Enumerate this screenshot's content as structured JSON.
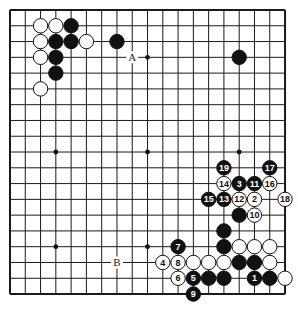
{
  "board": {
    "size": 19,
    "origin_x": 10,
    "origin_y": 10,
    "spacing_x": 15.28,
    "spacing_y": 15.78,
    "line_color": "#1a1a1a",
    "background": "#ffffff",
    "star_points": [
      [
        3,
        3
      ],
      [
        9,
        3
      ],
      [
        15,
        3
      ],
      [
        3,
        9
      ],
      [
        9,
        9
      ],
      [
        15,
        9
      ],
      [
        3,
        15
      ],
      [
        9,
        15
      ],
      [
        15,
        15
      ]
    ]
  },
  "stones": [
    {
      "color": "white",
      "col": 2,
      "row": 1,
      "label": ""
    },
    {
      "color": "white",
      "col": 3,
      "row": 1,
      "label": ""
    },
    {
      "color": "black",
      "col": 4,
      "row": 1,
      "label": ""
    },
    {
      "color": "white",
      "col": 2,
      "row": 2,
      "label": ""
    },
    {
      "color": "black",
      "col": 3,
      "row": 2,
      "label": ""
    },
    {
      "color": "black",
      "col": 4,
      "row": 2,
      "label": ""
    },
    {
      "color": "white",
      "col": 5,
      "row": 2,
      "label": ""
    },
    {
      "color": "black",
      "col": 7,
      "row": 2,
      "label": ""
    },
    {
      "color": "white",
      "col": 2,
      "row": 3,
      "label": ""
    },
    {
      "color": "black",
      "col": 3,
      "row": 3,
      "label": ""
    },
    {
      "color": "black",
      "col": 3,
      "row": 4,
      "label": ""
    },
    {
      "color": "white",
      "col": 2,
      "row": 5,
      "label": ""
    },
    {
      "color": "black",
      "col": 15,
      "row": 3,
      "label": ""
    },
    {
      "color": "black",
      "col": 14,
      "row": 10,
      "label": "19"
    },
    {
      "color": "black",
      "col": 17,
      "row": 10,
      "label": "17"
    },
    {
      "color": "white",
      "col": 14,
      "row": 11,
      "label": "14"
    },
    {
      "color": "black",
      "col": 15,
      "row": 11,
      "label": "3"
    },
    {
      "color": "black",
      "col": 16,
      "row": 11,
      "label": "11"
    },
    {
      "color": "white",
      "col": 17,
      "row": 11,
      "label": "16"
    },
    {
      "color": "black",
      "col": 13,
      "row": 12,
      "label": "15"
    },
    {
      "color": "black",
      "col": 14,
      "row": 12,
      "label": "13"
    },
    {
      "color": "white",
      "col": 15,
      "row": 12,
      "label": "12"
    },
    {
      "color": "white",
      "col": 16,
      "row": 12,
      "label": "2"
    },
    {
      "color": "white",
      "col": 18,
      "row": 12,
      "label": "18"
    },
    {
      "color": "black",
      "col": 15,
      "row": 13,
      "label": ""
    },
    {
      "color": "white",
      "col": 16,
      "row": 13,
      "label": "10"
    },
    {
      "color": "black",
      "col": 14,
      "row": 14,
      "label": ""
    },
    {
      "color": "black",
      "col": 11,
      "row": 15,
      "label": "7"
    },
    {
      "color": "black",
      "col": 14,
      "row": 15,
      "label": ""
    },
    {
      "color": "white",
      "col": 15,
      "row": 15,
      "label": ""
    },
    {
      "color": "white",
      "col": 16,
      "row": 15,
      "label": ""
    },
    {
      "color": "white",
      "col": 17,
      "row": 15,
      "label": ""
    },
    {
      "color": "white",
      "col": 10,
      "row": 16,
      "label": "4"
    },
    {
      "color": "white",
      "col": 11,
      "row": 16,
      "label": "8"
    },
    {
      "color": "white",
      "col": 12,
      "row": 16,
      "label": ""
    },
    {
      "color": "white",
      "col": 13,
      "row": 16,
      "label": ""
    },
    {
      "color": "white",
      "col": 14,
      "row": 16,
      "label": ""
    },
    {
      "color": "black",
      "col": 15,
      "row": 16,
      "label": ""
    },
    {
      "color": "black",
      "col": 16,
      "row": 16,
      "label": ""
    },
    {
      "color": "white",
      "col": 17,
      "row": 16,
      "label": ""
    },
    {
      "color": "white",
      "col": 11,
      "row": 17,
      "label": "6"
    },
    {
      "color": "black",
      "col": 12,
      "row": 17,
      "label": "5"
    },
    {
      "color": "black",
      "col": 13,
      "row": 17,
      "label": ""
    },
    {
      "color": "black",
      "col": 14,
      "row": 17,
      "label": ""
    },
    {
      "color": "black",
      "col": 16,
      "row": 17,
      "label": "1"
    },
    {
      "color": "black",
      "col": 17,
      "row": 17,
      "label": ""
    },
    {
      "color": "white",
      "col": 18,
      "row": 17,
      "label": ""
    },
    {
      "color": "black",
      "col": 12,
      "row": 18,
      "label": "9"
    }
  ],
  "markers": [
    {
      "col": 8,
      "row": 3,
      "label": "A"
    },
    {
      "col": 7,
      "row": 16,
      "label": "B"
    }
  ]
}
